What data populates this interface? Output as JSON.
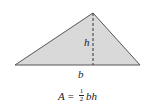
{
  "diagram": {
    "shape": "triangle",
    "fill_color": "#d9d9d9",
    "stroke_color": "#555555",
    "vertices": {
      "left": [
        15,
        65
      ],
      "apex": [
        93,
        13
      ],
      "right": [
        140,
        65
      ]
    },
    "height_label": "h",
    "base_label": "b",
    "formula": {
      "lhs": "A",
      "equals": "=",
      "frac_num": "1",
      "frac_den": "2",
      "rhs": "bh"
    }
  }
}
